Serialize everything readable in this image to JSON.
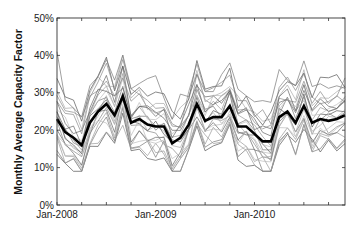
{
  "chart_data": {
    "type": "line",
    "title": "",
    "xlabel": "",
    "ylabel": "Monthly Average Capacity Factor",
    "ylim": [
      0,
      50
    ],
    "yticks": [
      0,
      10,
      20,
      30,
      40,
      50
    ],
    "ytick_labels": [
      "0%",
      "10%",
      "20%",
      "30%",
      "40%",
      "50%"
    ],
    "xtick_labels": [
      {
        "label": "Jan-2008",
        "month_index": 0
      },
      {
        "label": "Jan-2009",
        "month_index": 12
      },
      {
        "label": "Jan-2010",
        "month_index": 24
      }
    ],
    "minor_tick_interval_months": 3,
    "grid": false,
    "legend": null,
    "x": [
      "2008-01",
      "2008-02",
      "2008-03",
      "2008-04",
      "2008-05",
      "2008-06",
      "2008-07",
      "2008-08",
      "2008-09",
      "2008-10",
      "2008-11",
      "2008-12",
      "2009-01",
      "2009-02",
      "2009-03",
      "2009-04",
      "2009-05",
      "2009-06",
      "2009-07",
      "2009-08",
      "2009-09",
      "2009-10",
      "2009-11",
      "2009-12",
      "2010-01",
      "2010-02",
      "2010-03",
      "2010-04",
      "2010-05",
      "2010-06",
      "2010-07",
      "2010-08",
      "2010-09",
      "2010-10",
      "2010-11",
      "2010-12"
    ],
    "series": [
      {
        "name": "Mean",
        "style": "bold-black",
        "values": [
          23,
          19.5,
          18,
          16,
          22,
          25,
          27,
          24,
          29,
          22,
          23,
          21.5,
          21,
          21,
          16.5,
          18,
          21.5,
          27,
          22.5,
          23.5,
          23.5,
          26.5,
          21,
          21,
          19,
          17,
          17,
          23.5,
          25,
          22,
          26.5,
          22,
          23,
          22.5,
          23,
          24
        ]
      }
    ],
    "individual_series_note": "~20 thin gray lines (individual sites) spread roughly 10%-40% around the mean",
    "individual_offsets": [
      -8,
      -6.5,
      -5,
      -4,
      -3,
      -2,
      -1,
      0,
      1,
      2,
      3,
      4,
      5,
      6.5,
      8,
      10,
      -7,
      -2.5,
      3.5,
      7
    ],
    "colors": {
      "mean": "#000000",
      "individual": [
        "#555555",
        "#777777",
        "#999999",
        "#bbbbbb",
        "#666666",
        "#888888",
        "#aaaaaa"
      ],
      "axis": "#333333"
    }
  }
}
